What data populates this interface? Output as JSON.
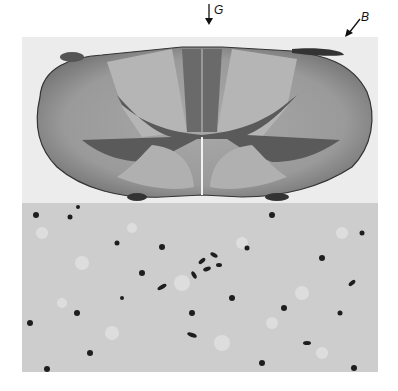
{
  "figure": {
    "labels": [
      {
        "text": "G",
        "meaning": "arrow marker at dorsal midline"
      },
      {
        "text": "B",
        "meaning": "arrow marker at dorsal right edge"
      }
    ],
    "panels": [
      {
        "name": "spinal-cord-cross-section",
        "description": "Low-magnification transverse section of spinal cord; darker central gray matter (butterfly shape) with lighter surrounding white matter; dark dorsal column region at midline"
      },
      {
        "name": "micrograph-detail",
        "description": "High-magnification field with scattered dark-stained nuclei on a pale vacuolated background, with a central cluster of cells"
      }
    ],
    "colors": {
      "background": "#ffffff",
      "tissue_light": "#b9b9b9",
      "tissue_mid": "#8e8e8e",
      "tissue_dark": "#5a5a5a",
      "nuclei": "#1e1e1e"
    }
  }
}
